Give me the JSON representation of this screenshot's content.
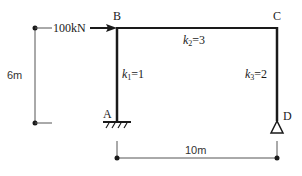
{
  "diagram": {
    "type": "portal-frame",
    "nodes": {
      "A": {
        "label": "A",
        "support": "fixed"
      },
      "B": {
        "label": "B"
      },
      "C": {
        "label": "C"
      },
      "D": {
        "label": "D",
        "support": "pin"
      }
    },
    "members": [
      {
        "id": "AB",
        "k_var": "k",
        "k_sub": "1",
        "k_value": "=1"
      },
      {
        "id": "BC",
        "k_var": "k",
        "k_sub": "2",
        "k_value": "=3"
      },
      {
        "id": "CD",
        "k_var": "k",
        "k_sub": "3",
        "k_value": "=2"
      }
    ],
    "load": {
      "label": "100kN",
      "direction": "right",
      "at": "B"
    },
    "dimensions": {
      "height": "6m",
      "span": "10m"
    },
    "colors": {
      "line": "#1a1a1a",
      "dim_line": "#555555"
    }
  }
}
